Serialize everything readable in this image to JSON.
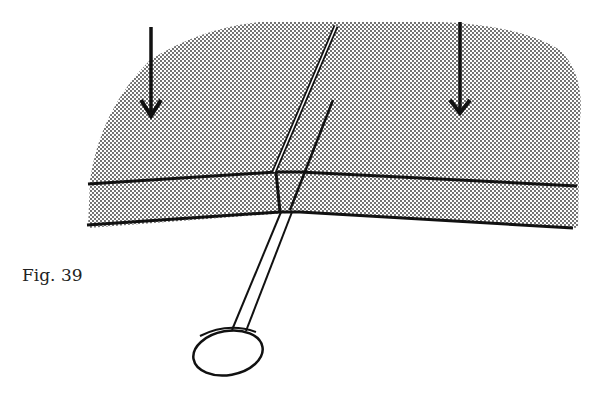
{
  "figure": {
    "caption": "Fig. 39",
    "elements": {
      "arrows": [
        "pressure-arrow-left",
        "pressure-arrow-right"
      ],
      "layers": [
        "top-layer",
        "bottom-layer"
      ],
      "pin": "pin-with-round-head"
    },
    "colors": {
      "ink": "#111111",
      "paper": "#ffffff",
      "stipple": "#333333"
    }
  }
}
